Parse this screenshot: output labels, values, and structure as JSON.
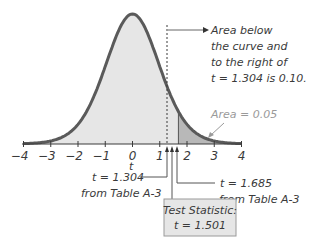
{
  "chart_data": {
    "type": "area",
    "title": "",
    "distribution": "Student t (right-tailed test)",
    "xlabel": "t",
    "ylabel": "",
    "xlim": [
      -4,
      4
    ],
    "x_ticks": [
      -4,
      -3,
      -2,
      -1,
      0,
      1,
      2,
      3,
      4
    ],
    "x_tick_labels": [
      "−4",
      "−3",
      "−2",
      "−1",
      "0",
      "1",
      "2",
      "3",
      "4"
    ],
    "grid": false,
    "legend": null,
    "critical_values": [
      {
        "t": 1.304,
        "label": "t = 1.304",
        "source": "from Table A-3",
        "line_style": "dashed"
      },
      {
        "t": 1.685,
        "label": "t = 1.685",
        "source": "from Table A-3",
        "line_style": "solid"
      }
    ],
    "test_statistic": {
      "t": 1.501,
      "title": "Test Statistic:",
      "label": "t = 1.501"
    },
    "shaded_regions": [
      {
        "from": -4,
        "to": 1.685,
        "color": "#e4e4e4",
        "description": "light fill under curve"
      },
      {
        "from": 1.685,
        "to": 4,
        "color": "#b5b5b5",
        "area": 0.05
      }
    ],
    "annotations": [
      {
        "text": [
          "Area below",
          "the curve and",
          "to the right of",
          "t = 1.304 is 0.10."
        ],
        "points_to_t": 1.304
      },
      {
        "text": "Area = 0.05",
        "points_to_t": 2.8
      }
    ]
  },
  "labels": {
    "axis_var": "t",
    "ann1": [
      "Area below",
      "the curve and",
      "to the right of",
      "t = 1.304 is 0.10."
    ],
    "ann2": "Area = 0.05",
    "cv1_line1": "t = 1.304",
    "cv1_line2": "from Table A-3",
    "cv2_line1": "t = 1.685",
    "cv2_line2": "from Table A-3",
    "ts_title": "Test Statistic:",
    "ts_value": "t = 1.501"
  },
  "colors": {
    "curve": "#5a5a5a",
    "fill_light": "#e6e6e6",
    "fill_dark": "#b8b8b8",
    "box_fill": "#e6e6e6",
    "box_border": "#9a9a9a"
  }
}
